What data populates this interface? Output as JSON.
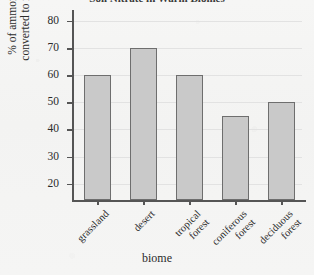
{
  "figure": {
    "title": "Soil Nitrate in Warm Biomes",
    "title_clipped": true,
    "background_color": "#f4f4f3",
    "bar_fill_color": "#c9c9c9",
    "bar_edge_color": "#6e6e6e",
    "axis_color": "#555555",
    "gridline_color": "#e2e2e2"
  },
  "chart_data": {
    "type": "bar",
    "title": "Soil Nitrate in Warm Biomes",
    "xlabel": "biome",
    "ylabel": "% of ammonium converted to nitrate",
    "ylabel_line1": "% of ammonium",
    "ylabel_line2": "converted to nitrate",
    "categories": [
      "grassland",
      "desert",
      "tropical forest",
      "coniferous forest",
      "deciduous forest"
    ],
    "category_lines": [
      [
        "grassland"
      ],
      [
        "desert"
      ],
      [
        "tropical",
        "forest"
      ],
      [
        "coniferous",
        "forest"
      ],
      [
        "deciduous",
        "forest"
      ]
    ],
    "values": [
      60,
      70,
      60,
      45,
      50
    ],
    "ylim": [
      14,
      84
    ],
    "yticks": [
      20,
      30,
      40,
      50,
      60,
      70,
      80
    ],
    "ytick_labels": [
      "20",
      "30",
      "40",
      "50",
      "60",
      "70",
      "80"
    ],
    "grid": true,
    "grid_axis": "y",
    "legend": null,
    "legend_position": "none",
    "orientation": "vertical"
  }
}
